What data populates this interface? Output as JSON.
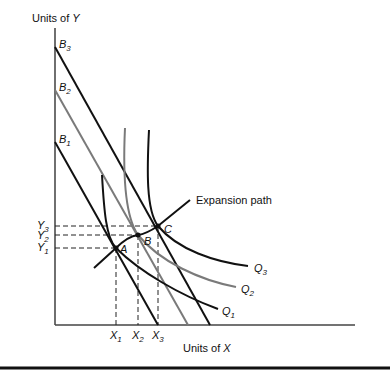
{
  "diagram": {
    "y_axis_label": "Units of ",
    "y_axis_var": "Y",
    "x_axis_label": "Units of ",
    "x_axis_var": "X",
    "budget_lines": [
      {
        "name": "B",
        "sub": "3",
        "color": "#111111"
      },
      {
        "name": "B",
        "sub": "2",
        "color": "#7a7a7a"
      },
      {
        "name": "B",
        "sub": "1",
        "color": "#111111"
      }
    ],
    "isoquants": [
      {
        "name": "Q",
        "sub": "1",
        "color": "#111111"
      },
      {
        "name": "Q",
        "sub": "2",
        "color": "#7a7a7a"
      },
      {
        "name": "Q",
        "sub": "3",
        "color": "#111111"
      }
    ],
    "points": [
      {
        "label": "A"
      },
      {
        "label": "B"
      },
      {
        "label": "C"
      }
    ],
    "x_ticks": [
      {
        "name": "X",
        "sub": "1"
      },
      {
        "name": "X",
        "sub": "2"
      },
      {
        "name": "X",
        "sub": "3"
      }
    ],
    "y_ticks": [
      {
        "name": "Y",
        "sub": "3"
      },
      {
        "name": "Y",
        "sub": "2"
      },
      {
        "name": "Y",
        "sub": "1"
      }
    ],
    "expansion_path_label": "Expansion path"
  }
}
